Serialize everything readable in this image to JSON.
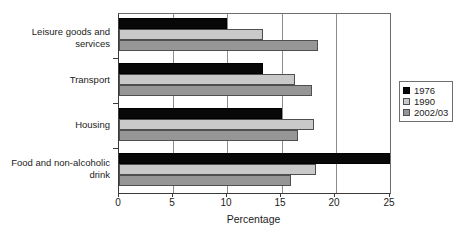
{
  "chart_data": {
    "type": "bar",
    "orientation": "horizontal",
    "title": "",
    "xlabel": "Percentage",
    "ylabel": "",
    "xlim": [
      0,
      25
    ],
    "xticks": [
      0,
      5,
      10,
      15,
      20,
      25
    ],
    "xtick_labels": [
      "0",
      "5",
      "10",
      "15",
      "20",
      "25"
    ],
    "grid": "vertical",
    "legend_position": "right",
    "categories": [
      "Leisure goods and services",
      "Transport",
      "Housing",
      "Food and non-alcoholic drink"
    ],
    "series": [
      {
        "name": "1976",
        "color": "#080808",
        "values": [
          10.0,
          13.3,
          15.0,
          25.0
        ]
      },
      {
        "name": "1990",
        "color": "#c9c9c9",
        "values": [
          13.3,
          16.2,
          18.0,
          18.2
        ]
      },
      {
        "name": "2002/03",
        "color": "#969696",
        "values": [
          18.4,
          17.8,
          16.5,
          15.9
        ]
      }
    ]
  },
  "legend": {
    "items": [
      {
        "label": "1976"
      },
      {
        "label": "1990"
      },
      {
        "label": "2002/03"
      }
    ]
  }
}
